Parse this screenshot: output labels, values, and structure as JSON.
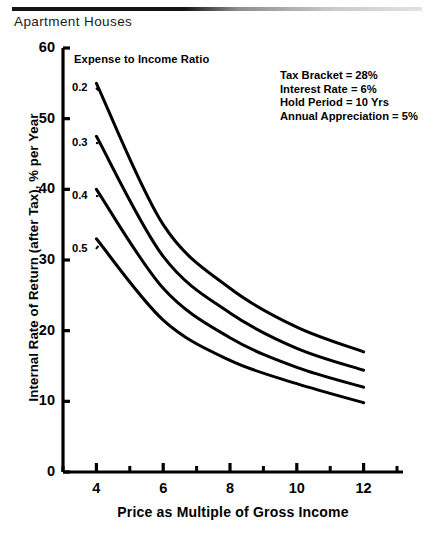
{
  "header": {
    "title": "Apartment Houses"
  },
  "chart_data": {
    "type": "line",
    "title": "Apartment Houses",
    "xlabel": "Price as Multiple of Gross Income",
    "ylabel": "Internal Rate of Return (after Tax), % per Year",
    "xlim": [
      3,
      13
    ],
    "ylim": [
      0,
      60
    ],
    "xticks": [
      4,
      6,
      8,
      10,
      12
    ],
    "xticklabels": [
      "4",
      "6",
      "8",
      "10",
      "12"
    ],
    "xminorticks": [
      3,
      5,
      7,
      9,
      11,
      13
    ],
    "yticks": [
      0,
      10,
      20,
      30,
      40,
      50,
      60
    ],
    "yticklabels": [
      "0",
      "10",
      "20",
      "30",
      "40",
      "50",
      "60"
    ],
    "grid": false,
    "legend_position": "inside-upper-left",
    "legend_title": "Expense to Income Ratio",
    "x": [
      4,
      6,
      8,
      10,
      12
    ],
    "series": [
      {
        "name": "0.2",
        "label": "0.2",
        "values": [
          55.0,
          35.0,
          26.0,
          20.5,
          17.0
        ]
      },
      {
        "name": "0.3",
        "label": "0.3",
        "values": [
          47.5,
          30.5,
          22.5,
          17.5,
          14.4
        ]
      },
      {
        "name": "0.4",
        "label": "0.4",
        "values": [
          40.0,
          26.0,
          19.0,
          14.8,
          12.0
        ]
      },
      {
        "name": "0.5",
        "label": "0.5",
        "values": [
          33.0,
          21.5,
          15.8,
          12.5,
          9.8
        ]
      }
    ],
    "annotations": [
      "Tax Bracket = 28%",
      "Interest Rate = 6%",
      "Hold Period = 10 Yrs",
      "Annual Appreciation = 5%"
    ],
    "line_color": "#000000"
  }
}
